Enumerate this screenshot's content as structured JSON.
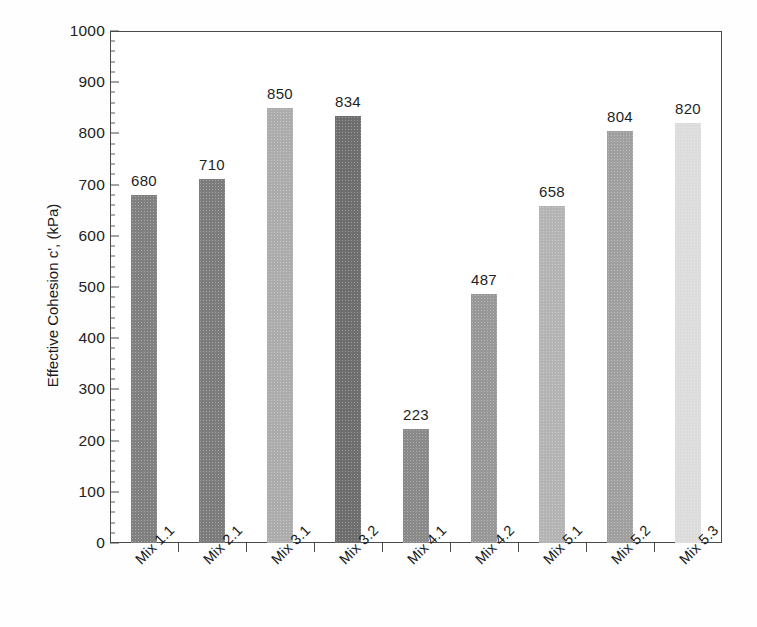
{
  "chart_data": {
    "type": "bar",
    "title": "",
    "xlabel": "",
    "ylabel": "Effective Cohesion c', (kPa)",
    "categories": [
      "Mix 1.1",
      "Mix 2.1",
      "Mix 3.1",
      "Mix 3.2",
      "Mix 4.1",
      "Mix 4.2",
      "Mix 5.1",
      "Mix 5.2",
      "Mix 5.3"
    ],
    "values": [
      680,
      710,
      850,
      834,
      223,
      487,
      658,
      804,
      820
    ],
    "bar_colors": [
      "#808080",
      "#7c7c7c",
      "#acacac",
      "#6e6e6e",
      "#8a8a8a",
      "#989898",
      "#b4b4b4",
      "#a0a0a0",
      "#dcdcdc"
    ],
    "ylim": [
      0,
      1000
    ],
    "y_major_ticks": [
      0,
      100,
      200,
      300,
      400,
      500,
      600,
      700,
      800,
      900,
      1000
    ],
    "y_minor_tick_interval": 20,
    "y_tick_labels": [
      "0",
      "100",
      "200",
      "300",
      "400",
      "500",
      "600",
      "700",
      "800",
      "900",
      "1000"
    ],
    "data_labels": [
      "680",
      "710",
      "850",
      "834",
      "223",
      "487",
      "658",
      "804",
      "820"
    ],
    "grid": false,
    "legend": false,
    "legend_position": "none",
    "x_label_rotation_deg": -45,
    "frame": "box"
  }
}
